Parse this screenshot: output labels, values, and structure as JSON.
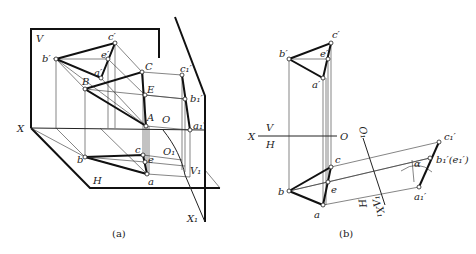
{
  "figure_a": {
    "caption": "(a)",
    "labels": {
      "V": "V",
      "X": "X",
      "H": "H",
      "O": "O",
      "O1": "O₁",
      "V1": "V₁",
      "X1": "X₁",
      "b_prime": "b′",
      "c_prime": "c′",
      "e_prime": "e′",
      "a_prime": "a′",
      "B": "B",
      "C": "C",
      "E": "E",
      "A": "A",
      "c1_prime": "c₁′",
      "b1_prime": "b₁′",
      "a1_prime": "a₁′",
      "b": "b",
      "c": "c",
      "e": "e",
      "a": "a"
    }
  },
  "figure_b": {
    "caption": "(b)",
    "labels": {
      "X": "X",
      "V": "V",
      "H": "H",
      "O": "O",
      "O1": "O₁",
      "H_new": "H",
      "V1": "V₁",
      "X1": "X₁",
      "b_prime": "b′",
      "c_prime": "c′",
      "e_prime": "e′",
      "a_prime": "a′",
      "b": "b",
      "c": "c",
      "e": "e",
      "a": "a",
      "c1_prime": "c₁′",
      "b1e1_prime": "b₁′(e₁′)",
      "a1_prime": "a₁′",
      "alpha": "α"
    }
  }
}
